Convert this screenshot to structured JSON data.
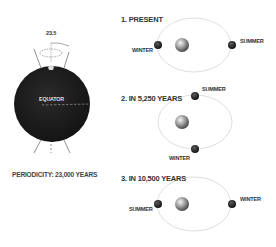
{
  "globe": {
    "tilt_label": "23.5",
    "equator_label": "EQUATOR",
    "periodicity_label": "PERIODICITY: 23,000 YEARS",
    "color": "#1e1e1e"
  },
  "panels": [
    {
      "title": "1. PRESENT",
      "left_label": "WINTER",
      "right_label": "SUMMER"
    },
    {
      "title": "2. IN 5,250 YEARS",
      "top_label": "SUMMER",
      "bottom_label": "WINTER"
    },
    {
      "title": "3. IN 10,500 YEARS",
      "left_label": "SUMMER",
      "right_label": "WINTER"
    }
  ],
  "colors": {
    "orbit": "#c8c8c8",
    "text": "#333333",
    "earth": "#222222"
  }
}
